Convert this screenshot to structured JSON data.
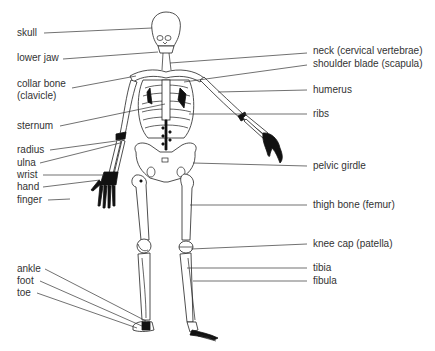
{
  "colors": {
    "line": "#333333",
    "bone_outline": "#222222",
    "dark_joints": "#111111",
    "background": "#ffffff"
  },
  "labels_left": [
    {
      "id": "skull",
      "text": "skull",
      "x": 17,
      "y": 32
    },
    {
      "id": "lower-jaw",
      "text": "lower jaw",
      "x": 17,
      "y": 57
    },
    {
      "id": "collar-bone",
      "text": "collar bone",
      "x": 17,
      "y": 83
    },
    {
      "id": "collar-bone-alt",
      "text": "(clavicle)",
      "x": 17,
      "y": 95
    },
    {
      "id": "sternum",
      "text": "sternum",
      "x": 17,
      "y": 122
    },
    {
      "id": "radius",
      "text": "radius",
      "x": 17,
      "y": 146
    },
    {
      "id": "ulna",
      "text": "ulna",
      "x": 17,
      "y": 159
    },
    {
      "id": "wrist",
      "text": "wrist",
      "x": 17,
      "y": 172
    },
    {
      "id": "hand",
      "text": "hand",
      "x": 17,
      "y": 184
    },
    {
      "id": "finger",
      "text": "finger",
      "x": 17,
      "y": 198
    },
    {
      "id": "ankle",
      "text": "ankle",
      "x": 17,
      "y": 265
    },
    {
      "id": "foot",
      "text": "foot",
      "x": 17,
      "y": 277
    },
    {
      "id": "toe",
      "text": "toe",
      "x": 17,
      "y": 289
    }
  ],
  "labels_right": [
    {
      "id": "neck",
      "text": "neck (cervical vertebrae)",
      "x": 313,
      "y": 47
    },
    {
      "id": "shoulder-blade",
      "text": "shoulder blade (scapula)",
      "x": 313,
      "y": 59
    },
    {
      "id": "humerus",
      "text": "humerus",
      "x": 313,
      "y": 84
    },
    {
      "id": "ribs",
      "text": "ribs",
      "x": 313,
      "y": 108
    },
    {
      "id": "pelvic-girdle",
      "text": "pelvic girdle",
      "x": 313,
      "y": 160
    },
    {
      "id": "thigh-bone",
      "text": "thigh bone (femur)",
      "x": 313,
      "y": 199
    },
    {
      "id": "knee-cap",
      "text": "knee cap (patella)",
      "x": 313,
      "y": 238
    },
    {
      "id": "tibia",
      "text": "tibia",
      "x": 313,
      "y": 262
    },
    {
      "id": "fibula",
      "text": "fibula",
      "x": 313,
      "y": 275
    }
  ]
}
